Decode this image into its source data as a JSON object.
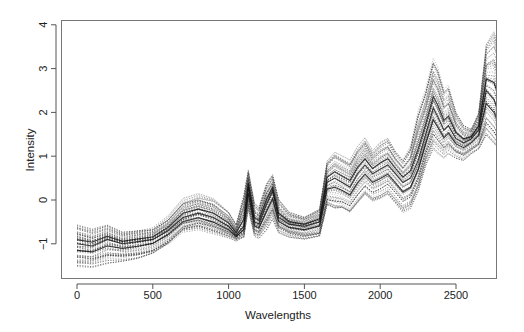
{
  "chart_data": {
    "type": "line",
    "title": "",
    "xlabel": "Wavelengths",
    "ylabel": "Intensity",
    "xlim": [
      -100,
      2870
    ],
    "ylim": [
      -1.8,
      4.1
    ],
    "x_ticks": [
      0,
      500,
      1000,
      1500,
      2000,
      2500
    ],
    "x_tick_labels": [
      "0",
      "500",
      "1000",
      "1500",
      "2000",
      "2500"
    ],
    "y_ticks": [
      -1,
      0,
      1,
      2,
      3,
      4
    ],
    "y_tick_labels": [
      "-1",
      "0",
      "1",
      "2",
      "3",
      "4"
    ],
    "grid": false,
    "legend": null,
    "line_style": "dotted",
    "n_series_approx": 60,
    "series_description": "Many overlaid spectra (dotted gray/black lines) of intensity vs wavelength",
    "x": [
      0,
      100,
      200,
      300,
      400,
      500,
      600,
      700,
      800,
      900,
      1000,
      1050,
      1100,
      1130,
      1170,
      1200,
      1250,
      1290,
      1330,
      1400,
      1500,
      1600,
      1650,
      1700,
      1750,
      1800,
      1850,
      1900,
      1950,
      2000,
      2050,
      2100,
      2150,
      2200,
      2250,
      2300,
      2350,
      2380,
      2420,
      2450,
      2500,
      2550,
      2600,
      2650,
      2700,
      2750,
      2800
    ],
    "series": [
      {
        "name": "upper envelope",
        "values": [
          -0.6,
          -0.7,
          -0.6,
          -0.75,
          -0.7,
          -0.65,
          -0.4,
          0.0,
          0.1,
          0.0,
          -0.3,
          -0.6,
          0.1,
          0.65,
          -0.1,
          -0.2,
          0.35,
          0.55,
          0.0,
          -0.3,
          -0.4,
          -0.2,
          0.9,
          1.1,
          1.0,
          0.9,
          1.2,
          1.4,
          1.1,
          1.3,
          1.4,
          1.1,
          0.9,
          1.2,
          2.0,
          2.5,
          3.2,
          3.0,
          2.5,
          2.6,
          2.0,
          1.7,
          1.6,
          2.0,
          3.6,
          3.9,
          3.4
        ]
      },
      {
        "name": "median",
        "values": [
          -1.0,
          -1.05,
          -0.9,
          -1.0,
          -0.95,
          -0.9,
          -0.7,
          -0.4,
          -0.3,
          -0.4,
          -0.6,
          -0.8,
          -0.6,
          0.3,
          -0.5,
          -0.55,
          -0.1,
          0.2,
          -0.4,
          -0.55,
          -0.6,
          -0.5,
          0.4,
          0.5,
          0.4,
          0.3,
          0.6,
          0.8,
          0.6,
          0.7,
          0.8,
          0.6,
          0.4,
          0.5,
          0.9,
          1.5,
          2.1,
          1.9,
          1.6,
          1.7,
          1.4,
          1.3,
          1.4,
          1.6,
          2.5,
          2.3,
          1.8
        ]
      },
      {
        "name": "lower envelope",
        "values": [
          -1.5,
          -1.5,
          -1.4,
          -1.35,
          -1.3,
          -1.2,
          -1.0,
          -0.7,
          -0.65,
          -0.75,
          -0.85,
          -0.9,
          -0.85,
          -0.2,
          -0.8,
          -0.85,
          -0.65,
          -0.4,
          -0.7,
          -0.8,
          -0.85,
          -0.8,
          -0.1,
          -0.2,
          -0.2,
          -0.3,
          -0.1,
          0.1,
          -0.05,
          0.0,
          0.1,
          -0.1,
          -0.3,
          -0.2,
          0.2,
          0.8,
          1.2,
          1.1,
          1.0,
          1.1,
          1.0,
          0.95,
          1.1,
          1.2,
          1.5,
          1.3,
          1.1
        ]
      }
    ]
  },
  "axes": {
    "x_title": "Wavelengths",
    "y_title": "Intensity"
  }
}
